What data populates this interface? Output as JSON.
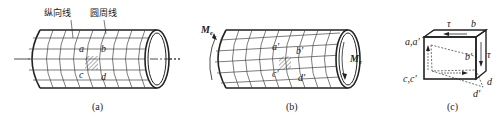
{
  "figure": {
    "panels": [
      {
        "id": "a",
        "caption": "(a)",
        "annotations": {
          "longitudinal_line": "纵向线",
          "circumferential_line": "圆周线"
        },
        "points": {
          "a": "a",
          "b": "b",
          "c": "c",
          "d": "d"
        }
      },
      {
        "id": "b",
        "caption": "(b)",
        "torque_left": {
          "symbol": "M",
          "subscript": "e"
        },
        "torque_right": {
          "symbol": "M",
          "subscript": "e"
        },
        "points": {
          "a": "a′",
          "b": "b′",
          "c": "c′",
          "d": "d′"
        }
      },
      {
        "id": "c",
        "caption": "(c)",
        "points": {
          "top_left": "a,a′",
          "top_right": "b",
          "mid_right": "b′",
          "bottom_left": "c,c′",
          "bottom_right": "d",
          "bottom_right_shifted": "d′"
        },
        "stress_top": "τ",
        "stress_right": "τ"
      }
    ]
  },
  "colors": {
    "line": "#222222",
    "background": "#ffffff"
  }
}
